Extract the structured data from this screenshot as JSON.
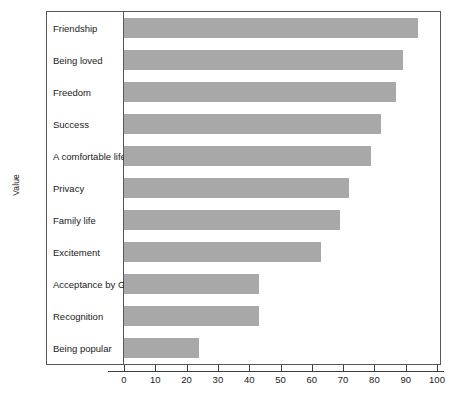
{
  "chart_data": {
    "type": "bar",
    "orientation": "horizontal",
    "title": "",
    "xlabel": "",
    "ylabel": "Value",
    "xlim": [
      0,
      100
    ],
    "xticks": [
      0,
      10,
      20,
      30,
      40,
      50,
      60,
      70,
      80,
      90,
      100
    ],
    "grid": false,
    "legend": null,
    "bar_color": "#a8a8a8",
    "frame_color": "#55595c",
    "categories": [
      "Friendship",
      "Being loved",
      "Freedom",
      "Success",
      "A comfortable life",
      "Privacy",
      "Family life",
      "Excitement",
      "Acceptance by God",
      "Recognition",
      "Being popular"
    ],
    "values": [
      94,
      89,
      87,
      82,
      79,
      72,
      69,
      63,
      43,
      43,
      24
    ]
  }
}
